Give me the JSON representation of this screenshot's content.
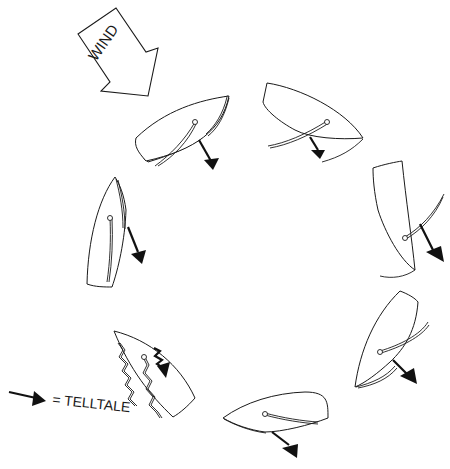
{
  "diagram": {
    "type": "sailing-points-of-sail-telltale-diagram",
    "wind_label": "WIND",
    "legend": {
      "symbol": "arrow-icon",
      "text": "= TELLTALE"
    },
    "colors": {
      "ink": "#1a1a1a",
      "background": "#ffffff"
    },
    "boats": [
      {
        "id": "boat-1",
        "position": "upper-left",
        "telltale": "streaming-aft"
      },
      {
        "id": "boat-2",
        "position": "top-right",
        "telltale": "streaming-aft"
      },
      {
        "id": "boat-3",
        "position": "right",
        "telltale": "streaming-aft"
      },
      {
        "id": "boat-4",
        "position": "lower-right",
        "telltale": "streaming-aft"
      },
      {
        "id": "boat-5",
        "position": "bottom",
        "telltale": "streaming-aft"
      },
      {
        "id": "boat-6",
        "position": "lower-left",
        "telltale": "fluttering",
        "sails": "luffing"
      },
      {
        "id": "boat-7",
        "position": "left",
        "telltale": "streaming-aft"
      }
    ]
  }
}
